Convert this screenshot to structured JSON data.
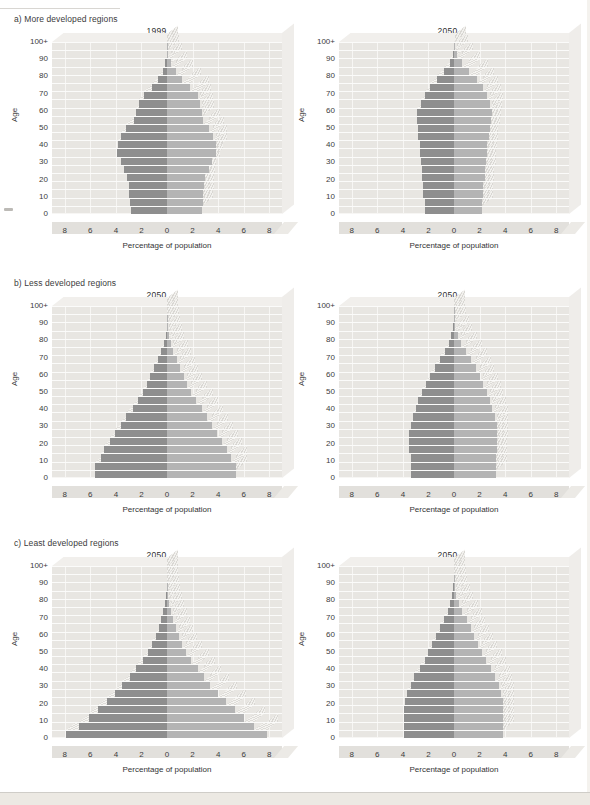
{
  "figure": {
    "axis_x_title": "Percentage of population",
    "axis_y_title": "Age",
    "label_males": "Males",
    "label_females": "Females",
    "x_ticks": [
      "8",
      "6",
      "4",
      "2",
      "0",
      "2",
      "4",
      "6",
      "8"
    ],
    "y_ticks": [
      "100+",
      "90",
      "80",
      "70",
      "60",
      "50",
      "40",
      "30",
      "20",
      "10",
      "0"
    ],
    "colors": {
      "male_bar": "#8e8e8e",
      "female_bar": "#b4b4b4",
      "plot_background": "#e8e6e2",
      "gridline": "#f7f6f4",
      "page_background": "#ffffff",
      "text": "#3a3a3a"
    }
  },
  "sections": [
    {
      "id": "a",
      "title": "a) More developed regions"
    },
    {
      "id": "b",
      "title": "b) Less developed regions"
    },
    {
      "id": "c",
      "title": "c) Least developed regions"
    }
  ],
  "chart_data": [
    {
      "type": "bar",
      "subtype": "population-pyramid",
      "panel": "a-left",
      "title": "1999",
      "section": "a) More developed regions",
      "xlabel": "Percentage of population",
      "ylabel": "Age",
      "xlim": [
        -9,
        9
      ],
      "xticks": [
        8,
        6,
        4,
        2,
        0,
        2,
        4,
        6,
        8
      ],
      "grid": true,
      "legend": [
        "Males",
        "Females"
      ],
      "legend_position": "top-inside",
      "age_groups": [
        "0-4",
        "5-9",
        "10-14",
        "15-19",
        "20-24",
        "25-29",
        "30-34",
        "35-39",
        "40-44",
        "45-49",
        "50-54",
        "55-59",
        "60-64",
        "65-69",
        "70-74",
        "75-79",
        "80-84",
        "85-89",
        "90-94",
        "95-99",
        "100+"
      ],
      "series": [
        {
          "name": "Males",
          "values": [
            2.8,
            2.9,
            3.0,
            3.0,
            3.1,
            3.4,
            3.6,
            3.9,
            3.8,
            3.6,
            3.2,
            2.6,
            2.4,
            2.2,
            1.8,
            1.2,
            0.7,
            0.35,
            0.12,
            0.03,
            0.01
          ]
        },
        {
          "name": "Females",
          "values": [
            2.7,
            2.8,
            2.8,
            2.9,
            3.0,
            3.3,
            3.5,
            3.8,
            3.8,
            3.6,
            3.3,
            2.8,
            2.7,
            2.6,
            2.4,
            1.8,
            1.2,
            0.7,
            0.28,
            0.07,
            0.02
          ]
        }
      ]
    },
    {
      "type": "bar",
      "subtype": "population-pyramid",
      "panel": "a-right",
      "title": "2050",
      "section": "a) More developed regions",
      "xlabel": "Percentage of population",
      "ylabel": "Age",
      "xlim": [
        -9,
        9
      ],
      "xticks": [
        8,
        6,
        4,
        2,
        0,
        2,
        4,
        6,
        8
      ],
      "grid": true,
      "legend": [
        "Males",
        "Females"
      ],
      "legend_position": "top-inside",
      "age_groups": [
        "0-4",
        "5-9",
        "10-14",
        "15-19",
        "20-24",
        "25-29",
        "30-34",
        "35-39",
        "40-44",
        "45-49",
        "50-54",
        "55-59",
        "60-64",
        "65-69",
        "70-74",
        "75-79",
        "80-84",
        "85-89",
        "90-94",
        "95-99",
        "100+"
      ],
      "series": [
        {
          "name": "Males",
          "values": [
            2.3,
            2.3,
            2.4,
            2.4,
            2.5,
            2.5,
            2.6,
            2.7,
            2.7,
            2.8,
            2.8,
            2.9,
            2.9,
            2.6,
            2.3,
            1.9,
            1.3,
            0.8,
            0.35,
            0.1,
            0.03
          ]
        },
        {
          "name": "Females",
          "values": [
            2.2,
            2.2,
            2.3,
            2.3,
            2.4,
            2.4,
            2.5,
            2.6,
            2.6,
            2.7,
            2.8,
            2.9,
            3.0,
            2.8,
            2.6,
            2.3,
            1.8,
            1.2,
            0.6,
            0.2,
            0.06
          ]
        }
      ]
    },
    {
      "type": "bar",
      "subtype": "population-pyramid",
      "panel": "b-left",
      "title": "2050",
      "section": "b) Less developed regions",
      "xlabel": "Percentage of population",
      "ylabel": "Age",
      "xlim": [
        -9,
        9
      ],
      "xticks": [
        8,
        6,
        4,
        2,
        0,
        2,
        4,
        6,
        8
      ],
      "grid": true,
      "legend": [
        "Males",
        "Females"
      ],
      "legend_position": "top-inside",
      "age_groups": [
        "0-4",
        "5-9",
        "10-14",
        "15-19",
        "20-24",
        "25-29",
        "30-34",
        "35-39",
        "40-44",
        "45-49",
        "50-54",
        "55-59",
        "60-64",
        "65-69",
        "70-74",
        "75-79",
        "80-84",
        "85-89",
        "90-94",
        "95-99",
        "100+"
      ],
      "series": [
        {
          "name": "Males",
          "values": [
            5.6,
            5.6,
            5.2,
            4.9,
            4.5,
            4.1,
            3.6,
            3.2,
            2.7,
            2.3,
            1.9,
            1.6,
            1.3,
            1.0,
            0.7,
            0.45,
            0.25,
            0.1,
            0.03,
            0.01,
            0.0
          ]
        },
        {
          "name": "Females",
          "values": [
            5.4,
            5.4,
            5.0,
            4.7,
            4.3,
            3.9,
            3.5,
            3.1,
            2.7,
            2.3,
            1.9,
            1.6,
            1.3,
            1.0,
            0.75,
            0.5,
            0.3,
            0.13,
            0.05,
            0.01,
            0.0
          ]
        }
      ]
    },
    {
      "type": "bar",
      "subtype": "population-pyramid",
      "panel": "b-right",
      "title": "2050",
      "section": "b) Less developed regions",
      "xlabel": "Percentage of population",
      "ylabel": "Age",
      "xlim": [
        -9,
        9
      ],
      "xticks": [
        8,
        6,
        4,
        2,
        0,
        2,
        4,
        6,
        8
      ],
      "grid": true,
      "legend": [
        "Males",
        "Females"
      ],
      "legend_position": "top-inside",
      "age_groups": [
        "0-4",
        "5-9",
        "10-14",
        "15-19",
        "20-24",
        "25-29",
        "30-34",
        "35-39",
        "40-44",
        "45-49",
        "50-54",
        "55-59",
        "60-64",
        "65-69",
        "70-74",
        "75-79",
        "80-84",
        "85-89",
        "90-94",
        "95-99",
        "100+"
      ],
      "series": [
        {
          "name": "Males",
          "values": [
            3.4,
            3.4,
            3.4,
            3.5,
            3.5,
            3.5,
            3.4,
            3.2,
            3.0,
            2.8,
            2.5,
            2.2,
            1.9,
            1.5,
            1.1,
            0.7,
            0.4,
            0.2,
            0.07,
            0.02,
            0.01
          ]
        },
        {
          "name": "Females",
          "values": [
            3.3,
            3.3,
            3.3,
            3.4,
            3.4,
            3.4,
            3.4,
            3.2,
            3.0,
            2.8,
            2.6,
            2.3,
            2.0,
            1.7,
            1.3,
            0.9,
            0.55,
            0.28,
            0.1,
            0.03,
            0.01
          ]
        }
      ]
    },
    {
      "type": "bar",
      "subtype": "population-pyramid",
      "panel": "c-left",
      "title": "2050",
      "section": "c) Least developed regions",
      "xlabel": "Percentage of population",
      "ylabel": "Age",
      "xlim": [
        -9,
        9
      ],
      "xticks": [
        8,
        6,
        4,
        2,
        0,
        2,
        4,
        6,
        8
      ],
      "grid": true,
      "legend": [
        "Males",
        "Females"
      ],
      "legend_position": "top-inside",
      "age_groups": [
        "0-4",
        "5-9",
        "10-14",
        "15-19",
        "20-24",
        "25-29",
        "30-34",
        "35-39",
        "40-44",
        "45-49",
        "50-54",
        "55-59",
        "60-64",
        "65-69",
        "70-74",
        "75-79",
        "80-84",
        "85-89",
        "90-94",
        "95-99",
        "100+"
      ],
      "series": [
        {
          "name": "Males",
          "values": [
            7.9,
            6.9,
            6.1,
            5.4,
            4.7,
            4.1,
            3.5,
            2.9,
            2.4,
            1.9,
            1.5,
            1.2,
            0.9,
            0.65,
            0.45,
            0.28,
            0.15,
            0.06,
            0.02,
            0.0,
            0.0
          ]
        },
        {
          "name": "Females",
          "values": [
            7.8,
            6.8,
            6.0,
            5.3,
            4.6,
            4.0,
            3.4,
            2.9,
            2.4,
            1.9,
            1.5,
            1.2,
            0.95,
            0.7,
            0.5,
            0.32,
            0.18,
            0.08,
            0.02,
            0.0,
            0.0
          ]
        }
      ]
    },
    {
      "type": "bar",
      "subtype": "population-pyramid",
      "panel": "c-right",
      "title": "2050",
      "section": "c) Least developed regions",
      "xlabel": "Percentage of population",
      "ylabel": "Age",
      "xlim": [
        -9,
        9
      ],
      "xticks": [
        8,
        6,
        4,
        2,
        0,
        2,
        4,
        6,
        8
      ],
      "grid": true,
      "legend": [
        "Males",
        "Females"
      ],
      "legend_position": "top-inside",
      "age_groups": [
        "0-4",
        "5-9",
        "10-14",
        "15-19",
        "20-24",
        "25-29",
        "30-34",
        "35-39",
        "40-44",
        "45-49",
        "50-54",
        "55-59",
        "60-64",
        "65-69",
        "70-74",
        "75-79",
        "80-84",
        "85-89",
        "90-94",
        "95-99",
        "100+"
      ],
      "series": [
        {
          "name": "Males",
          "values": [
            3.9,
            3.9,
            3.9,
            3.9,
            3.8,
            3.7,
            3.4,
            3.1,
            2.7,
            2.3,
            2.0,
            1.7,
            1.4,
            1.1,
            0.8,
            0.5,
            0.28,
            0.12,
            0.04,
            0.01,
            0.0
          ]
        },
        {
          "name": "Females",
          "values": [
            3.8,
            3.8,
            3.8,
            3.8,
            3.8,
            3.7,
            3.5,
            3.2,
            2.9,
            2.5,
            2.2,
            1.9,
            1.6,
            1.3,
            1.0,
            0.65,
            0.38,
            0.18,
            0.06,
            0.02,
            0.0
          ]
        }
      ]
    }
  ]
}
